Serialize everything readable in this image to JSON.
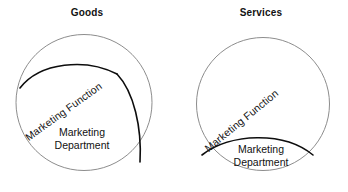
{
  "figure": {
    "name": "marketing-function-vs-department",
    "background_color": "#ffffff",
    "line_color": "#0d0d0d",
    "outer_circle_color": "#8d8d8d",
    "text_color": "#111111"
  },
  "panels": [
    {
      "id": "goods",
      "title": "Goods",
      "function_label": "Marketing Function",
      "department_label_line1": "Marketing",
      "department_label_line2": "Department",
      "function_share": "large",
      "description": "In goods, the marketing function occupies a large arc-bounded band of the organization circle, separate from the marketing department."
    },
    {
      "id": "services",
      "title": "Services",
      "function_label": "Marketing Function",
      "department_label_line1": "Marketing",
      "department_label_line2": "Department",
      "function_share": "small",
      "description": "In services, the marketing department is a small lens at the bottom of the circle while the marketing function spans nearly the whole organization."
    }
  ]
}
